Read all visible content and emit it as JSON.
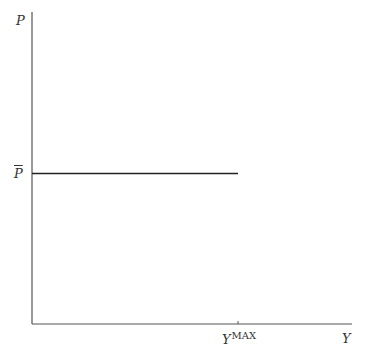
{
  "diagram": {
    "axes": {
      "y_label": "P",
      "x_label": "Y"
    },
    "price_level_label": "P",
    "price_level_bar": true,
    "x_tick_label_base": "Y",
    "x_tick_label_sup": "MAX",
    "colors": {
      "axis": "#555555",
      "line": "#222222",
      "text": "#333333"
    }
  }
}
